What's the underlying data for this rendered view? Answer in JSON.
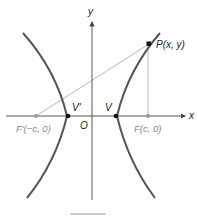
{
  "diagram": {
    "type": "hyperbola-focal-geometry",
    "axes": {
      "x_label": "x",
      "y_label": "y",
      "origin_label": "O"
    },
    "points": {
      "P": {
        "label": "P(x, y)"
      },
      "F": {
        "label": "F(c, 0)"
      },
      "F_prime": {
        "label": "F'(−c, 0)"
      },
      "V": {
        "label": "V"
      },
      "V_prime": {
        "label": "V'"
      }
    },
    "colors": {
      "curve": "#555555",
      "axes": "#444444",
      "focal_lines": "#aaaaaa",
      "focus_point": "#999999",
      "vertex_point": "#111111"
    },
    "caption": {
      "text": ""
    }
  }
}
